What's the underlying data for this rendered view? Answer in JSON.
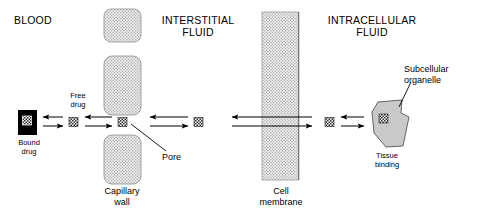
{
  "figure": {
    "title_regions": {
      "blood": "BLOOD",
      "interstitial_fluid": "INTERSTITIAL\nFLUID",
      "intracellular_fluid": "INTRACELLULAR\nFLUID"
    },
    "annotations": {
      "free_drug": "Free\ndrug",
      "bound_drug": "Bound\ndrug",
      "pore": "Pore",
      "capillary_wall": "Capillary\nwall",
      "cell_membrane": "Cell\nmembrane",
      "tissue_binding": "Tissue\nbinding",
      "subcellular_organelle": "Subcellular\norganelle"
    },
    "colors": {
      "line": "#000000",
      "stipple_fill": "#e9e9e9",
      "stipple_dot": "#9a9a9a",
      "organelle_fill": "#c8c8c8",
      "bound_drug_fill": "#000000",
      "background": "#ffffff"
    },
    "elements": {
      "capillary_wall_blocks": 3,
      "drug_molecule_icons": 5,
      "bidirectional_arrow_pairs": 4,
      "membrane_transit_arrows": 2
    }
  }
}
